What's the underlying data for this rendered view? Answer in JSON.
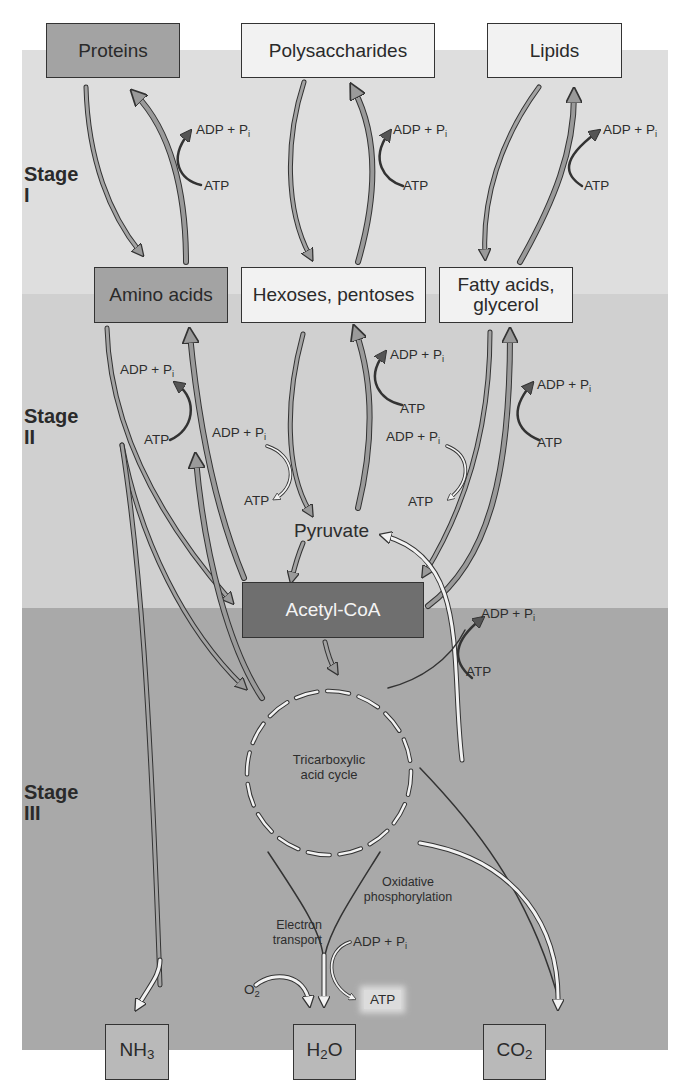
{
  "diagram": {
    "colors": {
      "stage1_bg": "#dedede",
      "stage2_bg": "#d0d0d0",
      "stage3_bg": "#a9a9a9",
      "box_light": "#f2f2f2",
      "box_mid": "#a3a3a3",
      "box_dark": "#6f6f6f",
      "arrow_fill": "#9a9a9a",
      "stroke": "#333333"
    },
    "stages": [
      {
        "label": "Stage",
        "numeral": "I"
      },
      {
        "label": "Stage",
        "numeral": "II"
      },
      {
        "label": "Stage",
        "numeral": "III"
      }
    ],
    "nodes": {
      "proteins": "Proteins",
      "polysaccharides": "Polysaccharides",
      "lipids": "Lipids",
      "amino_acids": "Amino acids",
      "hexoses_pentoses": "Hexoses, pentoses",
      "fatty_acids_line1": "Fatty acids,",
      "fatty_acids_line2": "glycerol",
      "pyruvate": "Pyruvate",
      "acetyl_coa": "Acetyl-CoA",
      "tca_line1": "Tricarboxylic",
      "tca_line2": "acid cycle",
      "nh3": "NH",
      "nh3_sub": "3",
      "h2o_h": "H",
      "h2o_sub": "2",
      "h2o_o": "O",
      "co2": "CO",
      "co2_sub": "2"
    },
    "energy_labels": {
      "adp": "ADP + P",
      "adp_sub": "i",
      "atp": "ATP",
      "o2": "O",
      "o2_sub": "2"
    },
    "pathway_labels": {
      "oxidative_line1": "Oxidative",
      "oxidative_line2": "phosphorylation",
      "electron_line1": "Electron",
      "electron_line2": "transport"
    }
  }
}
